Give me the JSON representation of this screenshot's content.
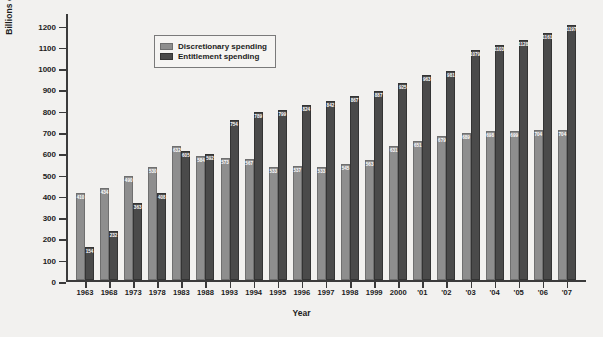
{
  "chart_data": {
    "type": "bar",
    "title": "",
    "xlabel": "Year",
    "ylabel": "Billions of constant 1996 dollars",
    "ylim": [
      0,
      1250
    ],
    "yticks": [
      0,
      100,
      200,
      300,
      400,
      500,
      600,
      700,
      800,
      900,
      1000,
      1100,
      1200
    ],
    "grid": false,
    "legend_position": "top-left",
    "categories": [
      "1963",
      "1968",
      "1973",
      "1978",
      "1983",
      "1988",
      "1993",
      "1994",
      "1995",
      "1996",
      "1997",
      "1998",
      "1999",
      "2000",
      "'01",
      "'02",
      "'03",
      "'04",
      "'05",
      "'06",
      "'07"
    ],
    "series": [
      {
        "name": "Discretionary spending",
        "color": "#8e8e8e",
        "values": [
          410,
          434,
          490,
          530,
          632,
          584,
          573,
          567,
          533,
          537,
          533,
          545,
          563,
          631,
          651,
          679,
          689,
          698,
          699,
          704,
          704
        ]
      },
      {
        "name": "Entitlement spending",
        "color": "#4a4a4a",
        "values": [
          154,
          232,
          363,
          408,
          605,
          592,
          754,
          789,
          799,
          824,
          842,
          867,
          887,
          925,
          963,
          981,
          1079,
          1103,
          1128,
          1161,
          1197
        ]
      }
    ]
  },
  "legend": {
    "items": [
      {
        "label": "Discretionary spending"
      },
      {
        "label": "Entitlement spending"
      }
    ]
  }
}
